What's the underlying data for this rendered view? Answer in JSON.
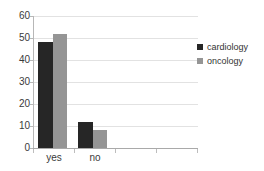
{
  "chart_data": {
    "type": "bar",
    "title": "",
    "xlabel": "",
    "ylabel": "",
    "categories": [
      "yes",
      "no"
    ],
    "series": [
      {
        "name": "cardiology",
        "color": "#262626",
        "values": [
          48,
          12
        ]
      },
      {
        "name": "oncology",
        "color": "#959595",
        "values": [
          52,
          8
        ]
      }
    ],
    "ylim": [
      0,
      60
    ],
    "yticks": [
      0,
      10,
      20,
      30,
      40,
      50,
      60
    ],
    "ytick_labels": [
      "0",
      "10",
      "20",
      "30",
      "40",
      "50",
      "60"
    ],
    "grid": true,
    "grid_axis": "y",
    "legend_position": "right",
    "background": "#ffffff"
  },
  "legend": {
    "entries": [
      {
        "label": "cardiology"
      },
      {
        "label": "oncology"
      }
    ]
  },
  "axes": {
    "y_tick_labels": [
      "60",
      "50",
      "40",
      "30",
      "20",
      "10",
      "0"
    ],
    "x_tick_labels": [
      "yes",
      "no"
    ]
  }
}
